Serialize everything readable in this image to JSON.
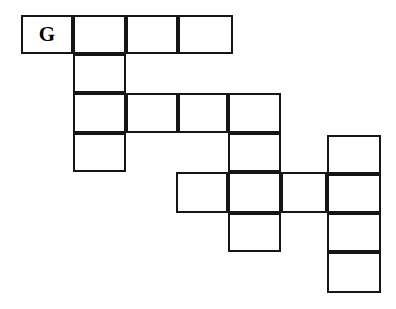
{
  "puzzle": {
    "title": "Crossword Grid",
    "style": {
      "background_color": "#ffffff",
      "line_color": "#161616",
      "cell_fill_color": "#ffffff",
      "letter_color": "#000000",
      "line_width_px": 2
    },
    "geometry": {
      "column_x": [
        21,
        73,
        126,
        178,
        228,
        281,
        327,
        381
      ],
      "row_y": [
        15,
        54,
        93,
        133,
        172,
        213,
        252,
        292
      ],
      "columns": 7,
      "rows": 7,
      "cell_width_px": 52,
      "cell_height_px": 39
    },
    "cells": [
      {
        "name": "cell-r0c0",
        "row": 0,
        "col": 0,
        "x": 21,
        "y": 15,
        "w": 52,
        "h": 39,
        "letter": "G"
      },
      {
        "name": "cell-r0c1",
        "row": 0,
        "col": 1,
        "x": 73,
        "y": 15,
        "w": 53,
        "h": 39,
        "letter": ""
      },
      {
        "name": "cell-r0c2",
        "row": 0,
        "col": 2,
        "x": 126,
        "y": 15,
        "w": 52,
        "h": 39,
        "letter": ""
      },
      {
        "name": "cell-r0c3",
        "row": 0,
        "col": 3,
        "x": 178,
        "y": 15,
        "w": 55,
        "h": 39,
        "letter": ""
      },
      {
        "name": "cell-r1c1",
        "row": 1,
        "col": 1,
        "x": 73,
        "y": 54,
        "w": 53,
        "h": 39,
        "letter": ""
      },
      {
        "name": "cell-r2c1",
        "row": 2,
        "col": 1,
        "x": 73,
        "y": 93,
        "w": 53,
        "h": 40,
        "letter": ""
      },
      {
        "name": "cell-r2c2",
        "row": 2,
        "col": 2,
        "x": 126,
        "y": 93,
        "w": 52,
        "h": 40,
        "letter": ""
      },
      {
        "name": "cell-r2c3",
        "row": 2,
        "col": 3,
        "x": 178,
        "y": 93,
        "w": 50,
        "h": 40,
        "letter": ""
      },
      {
        "name": "cell-r2c4",
        "row": 2,
        "col": 4,
        "x": 228,
        "y": 93,
        "w": 53,
        "h": 40,
        "letter": ""
      },
      {
        "name": "cell-r3c1",
        "row": 3,
        "col": 1,
        "x": 73,
        "y": 133,
        "w": 53,
        "h": 39,
        "letter": ""
      },
      {
        "name": "cell-r3c4",
        "row": 3,
        "col": 4,
        "x": 228,
        "y": 133,
        "w": 53,
        "h": 39,
        "letter": ""
      },
      {
        "name": "cell-r3c6",
        "row": 3,
        "col": 6,
        "x": 327,
        "y": 135,
        "w": 54,
        "h": 39,
        "letter": ""
      },
      {
        "name": "cell-r4c3",
        "row": 4,
        "col": 3,
        "x": 176,
        "y": 172,
        "w": 52,
        "h": 41,
        "letter": ""
      },
      {
        "name": "cell-r4c4",
        "row": 4,
        "col": 4,
        "x": 228,
        "y": 172,
        "w": 53,
        "h": 41,
        "letter": ""
      },
      {
        "name": "cell-r4c5",
        "row": 4,
        "col": 5,
        "x": 281,
        "y": 172,
        "w": 46,
        "h": 41,
        "letter": ""
      },
      {
        "name": "cell-r4c6",
        "row": 4,
        "col": 6,
        "x": 327,
        "y": 174,
        "w": 54,
        "h": 39,
        "letter": ""
      },
      {
        "name": "cell-r5c4",
        "row": 5,
        "col": 4,
        "x": 228,
        "y": 213,
        "w": 53,
        "h": 39,
        "letter": ""
      },
      {
        "name": "cell-r5c6",
        "row": 5,
        "col": 6,
        "x": 327,
        "y": 213,
        "w": 54,
        "h": 39,
        "letter": ""
      },
      {
        "name": "cell-r6c6",
        "row": 6,
        "col": 6,
        "x": 327,
        "y": 252,
        "w": 54,
        "h": 41,
        "letter": ""
      }
    ]
  }
}
